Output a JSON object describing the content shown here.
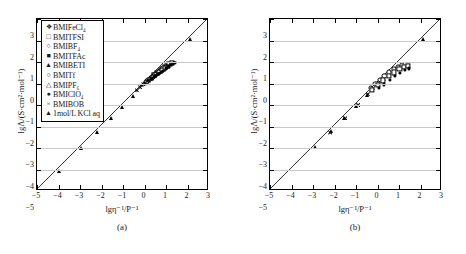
{
  "figure": {
    "panels": [
      {
        "id": "a",
        "caption": "(a)",
        "xlabel": "lgη⁻¹/P⁻¹",
        "ylabel": "lgΛ/(S·cm²·mol⁻¹)",
        "legend": [
          {
            "marker": "❖",
            "label": "BMIFeCl₄"
          },
          {
            "marker": "□",
            "label": "BMITFSI"
          },
          {
            "marker": "○",
            "label": "BMIBF₄"
          },
          {
            "marker": "■",
            "label": "BMITFAc"
          },
          {
            "marker": "▲",
            "label": "BMIBETI"
          },
          {
            "marker": "○",
            "label": "BMITf"
          },
          {
            "marker": "△",
            "label": "BMIPF₆"
          },
          {
            "marker": "●",
            "label": "BMIClO₄"
          },
          {
            "marker": "×",
            "label": "BMIBOB"
          },
          {
            "marker": "▲",
            "label": "1mol/L KCl aq"
          }
        ]
      },
      {
        "id": "b",
        "caption": "(b)",
        "xlabel": "lgη⁻¹/P⁻¹",
        "ylabel": "lgΛ/(S·cm²·mol⁻¹)",
        "legend": [
          {
            "marker": "○",
            "label": "MOENMe₂EBF₄"
          },
          {
            "marker": "×",
            "label": "MOENMe₂EBOB"
          },
          {
            "marker": "□",
            "label": "MOENMe₂ETFSI"
          },
          {
            "marker": "●",
            "label": "MOENMe₂EFeCl₄"
          },
          {
            "marker": "▲",
            "label": "1mol/L KCl aq"
          }
        ]
      }
    ]
  },
  "chart_data": [
    {
      "type": "scatter",
      "title": "",
      "panel": "(a)",
      "xlabel": "lgη⁻¹/P⁻¹",
      "ylabel": "lgΛ/(S·cm²·mol⁻¹)",
      "xlim": [
        -5,
        3
      ],
      "ylim": [
        -5,
        3
      ],
      "xticks": [
        -5,
        -4,
        -3,
        -2,
        -1,
        0,
        1,
        2,
        3
      ],
      "yticks": [
        -5,
        -4,
        -3,
        -2,
        -1,
        0,
        1,
        2,
        3
      ],
      "grid": "horizontal",
      "legend_position": "upper-left",
      "reference_line": {
        "label": "ideal KCl line",
        "slope": 1,
        "intercept": 0,
        "from": [
          -5,
          -5
        ],
        "to": [
          3,
          3
        ]
      },
      "series": [
        {
          "name": "BMIFeCl₄",
          "marker": "diamond-filled",
          "points": [
            [
              0.62,
              0.52
            ],
            [
              0.71,
              0.6
            ],
            [
              0.8,
              0.67
            ],
            [
              0.89,
              0.74
            ],
            [
              0.98,
              0.81
            ],
            [
              1.06,
              0.86
            ],
            [
              1.14,
              0.9
            ]
          ]
        },
        {
          "name": "BMITFSI",
          "marker": "square-open",
          "points": [
            [
              0.45,
              0.4
            ],
            [
              0.58,
              0.5
            ],
            [
              0.7,
              0.59
            ],
            [
              0.82,
              0.68
            ],
            [
              0.94,
              0.76
            ],
            [
              1.05,
              0.83
            ],
            [
              1.16,
              0.9
            ],
            [
              1.26,
              0.95
            ]
          ]
        },
        {
          "name": "BMIBF₄",
          "marker": "circle-open",
          "points": [
            [
              0.05,
              0.05
            ],
            [
              0.18,
              0.16
            ],
            [
              0.32,
              0.27
            ],
            [
              0.46,
              0.38
            ],
            [
              0.6,
              0.49
            ],
            [
              0.74,
              0.6
            ],
            [
              0.88,
              0.7
            ],
            [
              1.0,
              0.78
            ]
          ]
        },
        {
          "name": "BMITFAc",
          "marker": "square-filled",
          "points": [
            [
              0.7,
              0.55
            ],
            [
              0.84,
              0.64
            ],
            [
              0.98,
              0.73
            ],
            [
              1.1,
              0.8
            ],
            [
              1.22,
              0.86
            ],
            [
              1.32,
              0.92
            ],
            [
              1.4,
              0.96
            ]
          ]
        },
        {
          "name": "BMIBETI",
          "marker": "triangle-filled",
          "points": [
            [
              0.2,
              0.12
            ],
            [
              0.34,
              0.22
            ],
            [
              0.48,
              0.33
            ],
            [
              0.62,
              0.43
            ],
            [
              0.76,
              0.53
            ],
            [
              0.9,
              0.63
            ],
            [
              1.02,
              0.71
            ]
          ]
        },
        {
          "name": "BMITf",
          "marker": "circle-open-small",
          "points": [
            [
              0.12,
              0.1
            ],
            [
              0.26,
              0.21
            ],
            [
              0.4,
              0.32
            ],
            [
              0.54,
              0.43
            ],
            [
              0.68,
              0.53
            ],
            [
              0.82,
              0.63
            ],
            [
              0.95,
              0.72
            ]
          ]
        },
        {
          "name": "BMIPF₆",
          "marker": "triangle-open",
          "points": [
            [
              -0.1,
              -0.08
            ],
            [
              0.04,
              0.03
            ],
            [
              0.18,
              0.14
            ],
            [
              0.34,
              0.26
            ],
            [
              0.5,
              0.38
            ],
            [
              0.66,
              0.5
            ],
            [
              0.8,
              0.6
            ]
          ]
        },
        {
          "name": "BMIClO₄",
          "marker": "circle-filled",
          "points": [
            [
              0.3,
              0.2
            ],
            [
              0.44,
              0.3
            ],
            [
              0.58,
              0.4
            ],
            [
              0.72,
              0.5
            ],
            [
              0.86,
              0.6
            ],
            [
              1.0,
              0.7
            ],
            [
              1.12,
              0.78
            ]
          ]
        },
        {
          "name": "BMIBOB",
          "marker": "cross",
          "points": [
            [
              -0.35,
              -0.32
            ],
            [
              -0.2,
              -0.18
            ],
            [
              -0.05,
              -0.04
            ],
            [
              0.12,
              0.1
            ],
            [
              0.28,
              0.22
            ],
            [
              0.44,
              0.34
            ],
            [
              0.58,
              0.45
            ]
          ]
        },
        {
          "name": "1mol/L KCl aq",
          "marker": "triangle-filled-large",
          "points": [
            [
              -4.0,
              -4.05
            ],
            [
              -2.95,
              -3.0
            ],
            [
              -2.2,
              -2.25
            ],
            [
              -1.55,
              -1.6
            ],
            [
              -1.05,
              -1.1
            ],
            [
              -0.55,
              -0.58
            ],
            [
              2.1,
              2.05
            ]
          ]
        }
      ]
    },
    {
      "type": "scatter",
      "title": "",
      "panel": "(b)",
      "xlabel": "lgη⁻¹/P⁻¹",
      "ylabel": "lgΛ/(S·cm²·mol⁻¹)",
      "xlim": [
        -5,
        3
      ],
      "ylim": [
        -5,
        3
      ],
      "xticks": [
        -5,
        -4,
        -3,
        -2,
        -1,
        0,
        1,
        2,
        3
      ],
      "yticks": [
        -5,
        -4,
        -3,
        -2,
        -1,
        0,
        1,
        2,
        3
      ],
      "grid": "horizontal",
      "legend_position": "upper-left",
      "reference_line": {
        "label": "ideal KCl line",
        "slope": 1,
        "intercept": 0,
        "from": [
          -5,
          -5
        ],
        "to": [
          3,
          3
        ]
      },
      "series": [
        {
          "name": "MOENMe₂EBF₄",
          "marker": "circle-open",
          "points": [
            [
              -0.3,
              -0.2
            ],
            [
              -0.1,
              0.0
            ],
            [
              0.1,
              0.18
            ],
            [
              0.32,
              0.36
            ],
            [
              0.54,
              0.52
            ],
            [
              0.76,
              0.66
            ],
            [
              0.96,
              0.78
            ],
            [
              1.14,
              0.86
            ]
          ]
        },
        {
          "name": "MOENMe₂EBOB",
          "marker": "cross",
          "points": [
            [
              -2.2,
              -2.28
            ],
            [
              -1.5,
              -1.62
            ],
            [
              -0.9,
              -1.0
            ],
            [
              -0.45,
              -0.5
            ],
            [
              -0.2,
              -0.22
            ],
            [
              0.05,
              0.02
            ],
            [
              0.3,
              0.22
            ]
          ]
        },
        {
          "name": "MOENMe₂ETFSI",
          "marker": "square-open",
          "points": [
            [
              -0.25,
              -0.3
            ],
            [
              0.0,
              -0.08
            ],
            [
              0.26,
              0.14
            ],
            [
              0.52,
              0.34
            ],
            [
              0.78,
              0.52
            ],
            [
              1.02,
              0.66
            ],
            [
              1.24,
              0.76
            ],
            [
              1.42,
              0.82
            ]
          ]
        },
        {
          "name": "MOENMe₂EFeCl₄",
          "marker": "circle-filled",
          "points": [
            [
              0.05,
              -0.22
            ],
            [
              0.3,
              -0.04
            ],
            [
              0.56,
              0.16
            ],
            [
              0.82,
              0.34
            ],
            [
              1.06,
              0.5
            ],
            [
              1.28,
              0.62
            ],
            [
              1.46,
              0.7
            ]
          ]
        },
        {
          "name": "1mol/L KCl aq",
          "marker": "triangle-filled-large",
          "points": [
            [
              -4.95,
              -5.0
            ],
            [
              -2.9,
              -2.95
            ],
            [
              -2.15,
              -2.2
            ],
            [
              -1.55,
              -1.6
            ],
            [
              -1.0,
              -1.05
            ],
            [
              -0.5,
              -0.55
            ],
            [
              2.1,
              2.05
            ]
          ]
        }
      ]
    }
  ]
}
